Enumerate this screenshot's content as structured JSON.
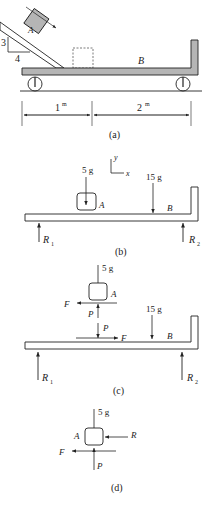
{
  "panel_a": {
    "caption": "(a)",
    "slope_rise": "3",
    "slope_run": "4",
    "block_a_label": "A",
    "cart_label": "B",
    "dim_left": "1",
    "dim_left_unit": "m",
    "dim_right": "2",
    "dim_right_unit": "m"
  },
  "panel_b": {
    "caption": "(b)",
    "weight_a": "5 g",
    "weight_b": "15 g",
    "block_label": "A",
    "cart_label": "B",
    "axis_x": "x",
    "axis_y": "y",
    "reaction_1": "R",
    "reaction_1_sub": "1",
    "reaction_2": "R",
    "reaction_2_sub": "2"
  },
  "panel_c": {
    "caption": "(c)",
    "weight_a": "5 g",
    "weight_b": "15 g",
    "block_label": "A",
    "cart_label": "B",
    "friction_on_a": "F",
    "normal_on_a": "P",
    "normal_on_b": "P",
    "friction_on_b": "F",
    "reaction_1": "R",
    "reaction_1_sub": "1",
    "reaction_2": "R",
    "reaction_2_sub": "2"
  },
  "panel_d": {
    "caption": "(d)",
    "weight_a": "5 g",
    "block_label": "A",
    "reaction": "R",
    "friction": "F",
    "normal": "P"
  },
  "colors": {
    "ink": "#222222",
    "fill_gray": "#b5b5b5"
  }
}
